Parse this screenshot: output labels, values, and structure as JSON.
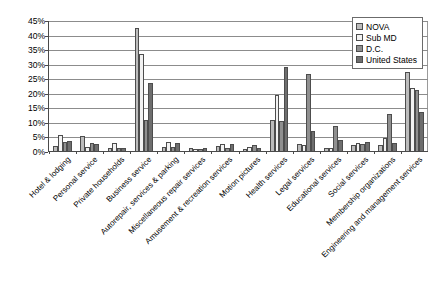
{
  "chart_data": {
    "type": "bar",
    "title": "",
    "subtitle": "",
    "xlabel": "",
    "ylabel": "",
    "ylim": [
      0,
      45
    ],
    "ytick_labels": [
      "0%",
      "5%",
      "10%",
      "15%",
      "20%",
      "25%",
      "30%",
      "35%",
      "40%",
      "45%"
    ],
    "ytick_values": [
      0,
      5,
      10,
      15,
      20,
      25,
      30,
      35,
      40,
      45
    ],
    "grid": true,
    "legend_position": "top-right",
    "categories": [
      "Hotel & lodging",
      "Personal service",
      "Private households",
      "Business service",
      "Autorepair, services & parking",
      "Miscellaneous repair services",
      "Amusement & recreation services",
      "Motion pictures",
      "Health services",
      "Legal services",
      "Educational services",
      "Social services",
      "Membership organizations",
      "Engineering and management services"
    ],
    "series": [
      {
        "name": "NOVA",
        "color": "#bcbcbc",
        "values": [
          1.6,
          5.3,
          1.2,
          42.2,
          1.5,
          1.0,
          1.6,
          0.6,
          10.6,
          2.4,
          1.1,
          2.0,
          2.2,
          27.2
        ]
      },
      {
        "name": "Sub MD",
        "color": "#f2f2f2",
        "values": [
          5.4,
          1.3,
          2.8,
          33.2,
          3.0,
          0.8,
          2.3,
          1.3,
          19.2,
          2.2,
          1.2,
          2.6,
          4.6,
          21.8
        ]
      },
      {
        "name": "D.C.",
        "color": "#8f8f8f",
        "values": [
          3.1,
          2.6,
          1.0,
          10.5,
          1.5,
          0.6,
          1.0,
          2.2,
          10.3,
          26.3,
          8.7,
          2.3,
          12.8,
          21.0
        ]
      },
      {
        "name": "United States",
        "color": "#6e6e6e",
        "values": [
          3.4,
          2.5,
          1.1,
          23.2,
          2.6,
          1.0,
          2.4,
          0.9,
          28.9,
          7.0,
          3.8,
          3.0,
          2.6,
          13.5
        ]
      }
    ]
  },
  "legend": {
    "items": [
      {
        "label": "NOVA"
      },
      {
        "label": "Sub MD"
      },
      {
        "label": "D.C."
      },
      {
        "label": "United States"
      }
    ]
  }
}
